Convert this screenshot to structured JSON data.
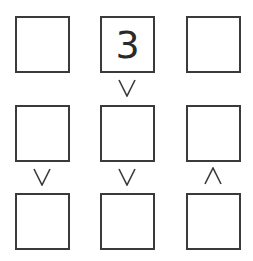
{
  "puzzle": {
    "type": "futoshiki",
    "size": 3,
    "grid": [
      [
        "",
        "3",
        ""
      ],
      [
        "",
        "",
        ""
      ],
      [
        "",
        "",
        ""
      ]
    ],
    "vertical_constraints": [
      {
        "between_rows": [
          1,
          2
        ],
        "column": 2,
        "symbol": "∨",
        "meaning": "top greater than bottom"
      },
      {
        "between_rows": [
          2,
          3
        ],
        "column": 1,
        "symbol": "∨",
        "meaning": "top greater than bottom"
      },
      {
        "between_rows": [
          2,
          3
        ],
        "column": 2,
        "symbol": "∨",
        "meaning": "top greater than bottom"
      },
      {
        "between_rows": [
          2,
          3
        ],
        "column": 3,
        "symbol": "∧",
        "meaning": "top less than bottom"
      }
    ],
    "colors": {
      "border": "#3a3a3a",
      "text": "#2a2a2a",
      "background": "#ffffff"
    }
  }
}
